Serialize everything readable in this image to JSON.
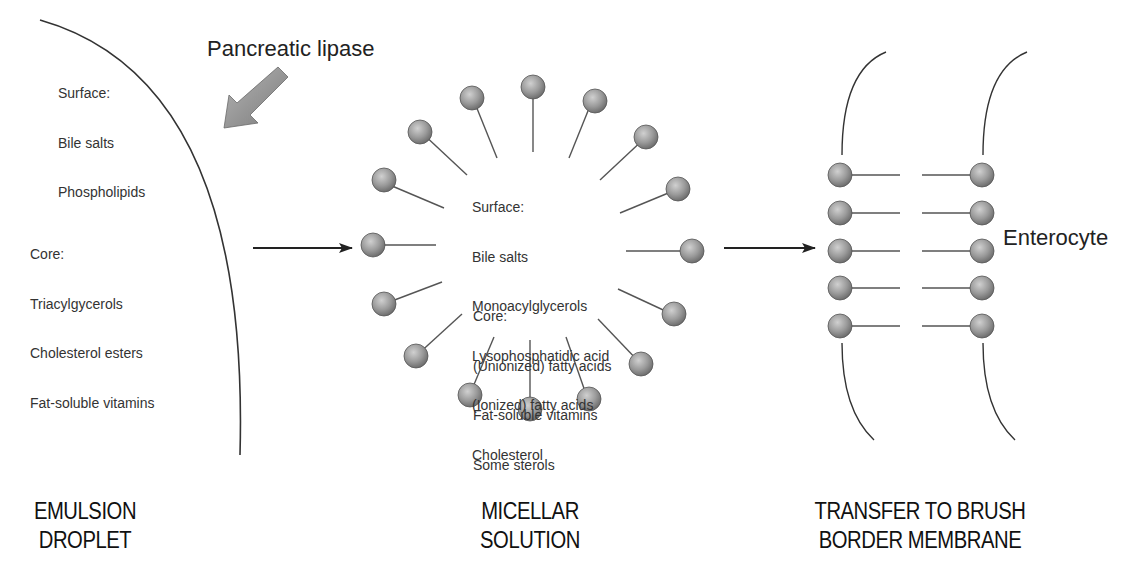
{
  "emulsion": {
    "surface_label": "Surface:",
    "surface_items": [
      "Bile salts",
      "Phospholipids"
    ],
    "core_label": "Core:",
    "core_items": [
      "Triacylgycerols",
      "Cholesterol esters",
      "Fat-soluble vitamins"
    ],
    "caption_line1": "EMULSION",
    "caption_line2": "DROPLET"
  },
  "enzyme": {
    "label": "Pancreatic lipase"
  },
  "micelle": {
    "surface_label": "Surface:",
    "surface_items": [
      "Bile salts",
      "Monoacylglycerols",
      "Lysophosphatidic acid",
      "(Ionized) fatty acids",
      "Cholesterol"
    ],
    "core_label": "Core:",
    "core_items": [
      "(Unionized) fatty acids",
      "Fat-soluble vitamins",
      "Some sterols"
    ],
    "caption_line1": "MICELLAR",
    "caption_line2": "SOLUTION"
  },
  "membrane": {
    "cell_label": "Enterocyte",
    "caption_line1": "TRANSFER TO BRUSH",
    "caption_line2": "BORDER MEMBRANE"
  },
  "colors": {
    "sphere_fill": "#9a9a9a",
    "line": "#555555",
    "arrow": "#222222",
    "lipase_arrow": "#8c8c8c"
  }
}
